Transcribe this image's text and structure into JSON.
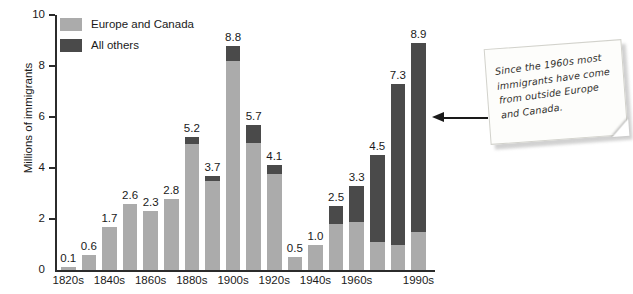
{
  "chart_data": {
    "type": "bar",
    "title": "",
    "subtitle": "",
    "xlabel": "",
    "ylabel": "Millions of immigrants",
    "ylim": [
      0,
      10
    ],
    "yticks": [
      0,
      2,
      4,
      6,
      8,
      10
    ],
    "grid": false,
    "stacked": true,
    "legend_position": "top-left",
    "legend": [
      "Europe and Canada",
      "All others"
    ],
    "categories": [
      "1820s",
      "1830s",
      "1840s",
      "1850s",
      "1860s",
      "1870s",
      "1880s",
      "1890s",
      "1900s",
      "1910s",
      "1920s",
      "1930s",
      "1940s",
      "1950s",
      "1960s",
      "1970s",
      "1980s",
      "1990s"
    ],
    "tick_labels": [
      "1820s",
      "",
      "1840s",
      "",
      "1860s",
      "",
      "1880s",
      "",
      "1900s",
      "",
      "1920s",
      "",
      "1940s",
      "",
      "1960s",
      "",
      "",
      "1990s"
    ],
    "totals": [
      0.1,
      0.6,
      1.7,
      2.6,
      2.3,
      2.8,
      5.2,
      3.7,
      8.8,
      5.7,
      4.1,
      0.5,
      1.0,
      2.5,
      3.3,
      4.5,
      7.3,
      8.9
    ],
    "data_labels": [
      "0.1",
      "0.6",
      "1.7",
      "2.6",
      "2.3",
      "2.8",
      "5.2",
      "3.7",
      "8.8",
      "5.7",
      "4.1",
      "0.5",
      "1.0",
      "2.5",
      "3.3",
      "4.5",
      "7.3",
      "8.9"
    ],
    "series": [
      {
        "name": "Europe and Canada",
        "color": "#ababab",
        "values": [
          0.1,
          0.6,
          1.7,
          2.6,
          2.3,
          2.8,
          4.95,
          3.5,
          8.2,
          5.0,
          3.75,
          0.5,
          1.0,
          1.8,
          1.9,
          1.1,
          1.0,
          1.5
        ]
      },
      {
        "name": "All others",
        "color": "#4a4a4a",
        "values": [
          0.0,
          0.0,
          0.0,
          0.0,
          0.0,
          0.0,
          0.25,
          0.2,
          0.6,
          0.7,
          0.35,
          0.0,
          0.0,
          0.7,
          1.4,
          3.4,
          6.3,
          7.4
        ]
      }
    ]
  },
  "callout": {
    "text": "Since the 1960s most immigrants have come from outside Europe and Canada.",
    "arrow": "left-arrow-icon"
  },
  "colors": {
    "light_gray": "#ababab",
    "dark_gray": "#4a4a4a",
    "axis": "#2b2b2b",
    "text": "#1a1a1a",
    "note_paper": "#fdfdfb"
  }
}
